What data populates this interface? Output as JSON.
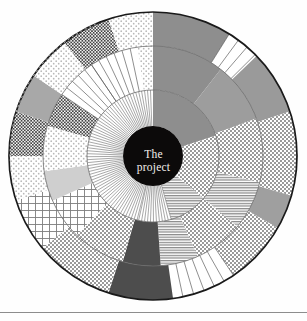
{
  "figure": {
    "name": "radial-project-wheel",
    "center_label": {
      "line1": "The",
      "line2": "project"
    },
    "center_circle": {
      "fill": "#0c0a0a",
      "cx": 153,
      "cy": 156,
      "r": 30
    },
    "outer_circle": {
      "cx": 153,
      "cy": 156,
      "r": 144,
      "stroke": "#1a1a1a",
      "stroke_width": 1.6,
      "fill": "#ffffff"
    },
    "rings": [
      {
        "name": "inner-ring",
        "r_inner": 30,
        "r_outer": 66
      },
      {
        "name": "middle-ring",
        "r_inner": 66,
        "r_outer": 110
      },
      {
        "name": "outer-ring",
        "r_inner": 110,
        "r_outer": 144
      }
    ],
    "ring_guides": [
      {
        "r": 66,
        "stroke": "#6d6d6d"
      },
      {
        "r": 110,
        "stroke": "#6d6d6d"
      }
    ],
    "palette": {
      "ink": "#1a1a1a",
      "black": "#0c0a0a",
      "dark_gray": "#4d4d4d",
      "mid_gray": "#8c8c8c",
      "gray": "#a5a5a5",
      "light_gray": "#c9c9c9",
      "pale_gray": "#e2e2e2",
      "white": "#ffffff",
      "rule": "#8d8d8d"
    },
    "bottom_rule": {
      "y": 312,
      "color": "#8d8d8d"
    },
    "sectors": [
      {
        "id": "s01",
        "ring": "outer",
        "a0": -90,
        "a1": -58,
        "fill": "pattern",
        "pattern": "solid-gray",
        "tone": "#8e8e8e"
      },
      {
        "id": "s02",
        "ring": "outer",
        "a0": -58,
        "a1": -44,
        "fill": "pattern",
        "pattern": "radial-ticks",
        "tone": "#ffffff"
      },
      {
        "id": "s03",
        "ring": "outer",
        "a0": -44,
        "a1": -18,
        "fill": "pattern",
        "pattern": "solid-gray",
        "tone": "#9a9a9a"
      },
      {
        "id": "s04",
        "ring": "outer",
        "a0": -18,
        "a1": 16,
        "fill": "pattern",
        "pattern": "dots-medium",
        "tone": "#8a8a8a"
      },
      {
        "id": "s05",
        "ring": "outer",
        "a0": 16,
        "a1": 30,
        "fill": "pattern",
        "pattern": "solid-gray",
        "tone": "#9f9f9f"
      },
      {
        "id": "s06",
        "ring": "outer",
        "a0": 30,
        "a1": 56,
        "fill": "pattern",
        "pattern": "dots-medium",
        "tone": "#8a8a8a"
      },
      {
        "id": "s07",
        "ring": "outer",
        "a0": 56,
        "a1": 82,
        "fill": "pattern",
        "pattern": "radial-ticks",
        "tone": "#ffffff"
      },
      {
        "id": "s08",
        "ring": "outer",
        "a0": 82,
        "a1": 108,
        "fill": "pattern",
        "pattern": "solid-dark",
        "tone": "#4d4d4d"
      },
      {
        "id": "s09",
        "ring": "outer",
        "a0": 108,
        "a1": 140,
        "fill": "pattern",
        "pattern": "dots-medium",
        "tone": "#8f8f8f"
      },
      {
        "id": "s10",
        "ring": "outer",
        "a0": 140,
        "a1": 162,
        "fill": "pattern",
        "pattern": "grid-lines",
        "tone": "#7d7d7d"
      },
      {
        "id": "s11",
        "ring": "outer",
        "a0": 162,
        "a1": 180,
        "fill": "pattern",
        "pattern": "dots-light",
        "tone": "#b5b5b5"
      },
      {
        "id": "s12",
        "ring": "outer",
        "a0": 180,
        "a1": 198,
        "fill": "pattern",
        "pattern": "dots-dense",
        "tone": "#7a7a7a"
      },
      {
        "id": "s13",
        "ring": "outer",
        "a0": 198,
        "a1": 214,
        "fill": "pattern",
        "pattern": "solid-gray",
        "tone": "#a8a8a8"
      },
      {
        "id": "s14",
        "ring": "outer",
        "a0": 214,
        "a1": 232,
        "fill": "pattern",
        "pattern": "dots-light",
        "tone": "#c0c0c0"
      },
      {
        "id": "s15",
        "ring": "outer",
        "a0": 232,
        "a1": 252,
        "fill": "pattern",
        "pattern": "dots-dense",
        "tone": "#5e5e5e"
      },
      {
        "id": "s16",
        "ring": "outer",
        "a0": 252,
        "a1": 270,
        "fill": "pattern",
        "pattern": "dots-light",
        "tone": "#bdbdbd"
      },
      {
        "id": "m01",
        "ring": "middle",
        "a0": -90,
        "a1": -52,
        "fill": "pattern",
        "pattern": "solid-gray",
        "tone": "#8e8e8e"
      },
      {
        "id": "m02",
        "ring": "middle",
        "a0": -52,
        "a1": -20,
        "fill": "pattern",
        "pattern": "solid-gray",
        "tone": "#9d9d9d"
      },
      {
        "id": "m03",
        "ring": "middle",
        "a0": -20,
        "a1": 14,
        "fill": "pattern",
        "pattern": "dots-medium",
        "tone": "#8a8a8a"
      },
      {
        "id": "m04",
        "ring": "middle",
        "a0": 14,
        "a1": 40,
        "fill": "pattern",
        "pattern": "h-lines",
        "tone": "#7f7f7f"
      },
      {
        "id": "m05",
        "ring": "middle",
        "a0": 40,
        "a1": 66,
        "fill": "pattern",
        "pattern": "dots-medium",
        "tone": "#8d8d8d"
      },
      {
        "id": "m06",
        "ring": "middle",
        "a0": 66,
        "a1": 86,
        "fill": "pattern",
        "pattern": "h-lines",
        "tone": "#8a8a8a"
      },
      {
        "id": "m07",
        "ring": "middle",
        "a0": 86,
        "a1": 106,
        "fill": "pattern",
        "pattern": "solid-dark",
        "tone": "#4d4d4d"
      },
      {
        "id": "m08",
        "ring": "middle",
        "a0": 106,
        "a1": 134,
        "fill": "pattern",
        "pattern": "dots-medium",
        "tone": "#949494"
      },
      {
        "id": "m09",
        "ring": "middle",
        "a0": 134,
        "a1": 156,
        "fill": "pattern",
        "pattern": "grid-lines",
        "tone": "#7d7d7d"
      },
      {
        "id": "m10",
        "ring": "middle",
        "a0": 156,
        "a1": 172,
        "fill": "pattern",
        "pattern": "solid-gray",
        "tone": "#cfcfcf"
      },
      {
        "id": "m11",
        "ring": "middle",
        "a0": 172,
        "a1": 196,
        "fill": "pattern",
        "pattern": "dots-light",
        "tone": "#bdbdbd"
      },
      {
        "id": "m12",
        "ring": "middle",
        "a0": 196,
        "a1": 214,
        "fill": "pattern",
        "pattern": "dots-dense",
        "tone": "#7a7a7a"
      },
      {
        "id": "m13",
        "ring": "middle",
        "a0": 214,
        "a1": 236,
        "fill": "pattern",
        "pattern": "radial-ticks",
        "tone": "#ffffff"
      },
      {
        "id": "m14",
        "ring": "middle",
        "a0": 236,
        "a1": 262,
        "fill": "pattern",
        "pattern": "radial-ticks",
        "tone": "#ffffff"
      },
      {
        "id": "m15",
        "ring": "middle",
        "a0": 262,
        "a1": 270,
        "fill": "pattern",
        "pattern": "dots-light",
        "tone": "#c6c6c6"
      },
      {
        "id": "i01",
        "ring": "inner",
        "a0": -90,
        "a1": -18,
        "fill": "pattern",
        "pattern": "solid-gray",
        "tone": "#8e8e8e"
      },
      {
        "id": "i02",
        "ring": "inner",
        "a0": -18,
        "a1": 40,
        "fill": "pattern",
        "pattern": "dots-medium",
        "tone": "#8a8a8a"
      },
      {
        "id": "i03",
        "ring": "inner",
        "a0": 40,
        "a1": 74,
        "fill": "pattern",
        "pattern": "h-lines",
        "tone": "#8a8a8a"
      },
      {
        "id": "i04",
        "ring": "inner",
        "a0": 74,
        "a1": 104,
        "fill": "pattern",
        "pattern": "radial-fine",
        "tone": "#ffffff"
      },
      {
        "id": "i05",
        "ring": "inner",
        "a0": 104,
        "a1": 270,
        "fill": "pattern",
        "pattern": "radial-fine",
        "tone": "#ffffff"
      }
    ]
  }
}
